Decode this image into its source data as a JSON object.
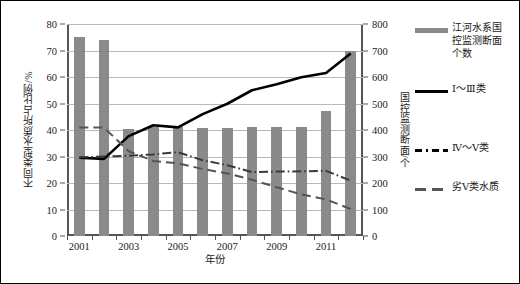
{
  "chart_data": {
    "type": "bar",
    "title": "",
    "xlabel": "年份",
    "ylabel": "不同类型水质所占比例/%",
    "ylabel_secondary": "国控监测断面/个",
    "grid": true,
    "legend_position": "right",
    "ylim": [
      0,
      80
    ],
    "ylim_secondary": [
      0,
      800
    ],
    "yticks": [
      0,
      10,
      20,
      30,
      40,
      50,
      60,
      70,
      80
    ],
    "yticks_secondary": [
      0,
      100,
      200,
      300,
      400,
      500,
      600,
      700,
      800
    ],
    "categories": [
      2001,
      2002,
      2003,
      2004,
      2005,
      2006,
      2007,
      2008,
      2009,
      2010,
      2011,
      2012
    ],
    "xtick_labels": [
      "2001",
      "",
      "2003",
      "",
      "2005",
      "",
      "2007",
      "",
      "2009",
      "",
      "2011",
      ""
    ],
    "series": [
      {
        "name": "江河水系国控监测断面个数",
        "type": "bar",
        "axis": "secondary",
        "color": "#8a8a8a",
        "values": [
          752,
          741,
          404,
          412,
          411,
          409,
          408,
          412,
          413,
          412,
          470,
          700
        ]
      },
      {
        "name": "Ⅰ～Ⅲ类",
        "type": "line",
        "style": "solid",
        "axis": "primary",
        "color": "#000000",
        "values": [
          29.5,
          29.1,
          37.7,
          41.8,
          41.0,
          46.0,
          49.9,
          55.0,
          57.3,
          59.9,
          61.5,
          68.9
        ]
      },
      {
        "name": "Ⅳ～Ⅴ类",
        "type": "line",
        "style": "dash-dot",
        "axis": "primary",
        "color": "#3a3a3a",
        "values": [
          29.7,
          30.0,
          30.3,
          30.8,
          31.6,
          28.6,
          26.7,
          24.1,
          24.3,
          24.4,
          24.6,
          20.9
        ]
      },
      {
        "name": "劣Ⅴ类水质",
        "type": "line",
        "style": "dashed",
        "axis": "primary",
        "color": "#555555",
        "values": [
          40.9,
          40.9,
          32.0,
          28.3,
          27.4,
          25.3,
          23.6,
          21.2,
          18.4,
          15.7,
          13.8,
          10.2
        ]
      }
    ]
  },
  "legend": {
    "items": [
      {
        "key": "bar-swatch",
        "label": "江河水系国\n控监测断面\n个数"
      },
      {
        "key": "solid-line",
        "label": "Ⅰ～Ⅲ类"
      },
      {
        "key": "dash-dot-line",
        "label": "Ⅳ～Ⅴ类"
      },
      {
        "key": "dashed-line",
        "label": "劣Ⅴ类水质"
      }
    ]
  },
  "colors": {
    "bar": "#8a8a8a",
    "series_primary": "#000000",
    "grid": "#b9b9b9",
    "axis": "#555555",
    "background": "#ffffff"
  }
}
